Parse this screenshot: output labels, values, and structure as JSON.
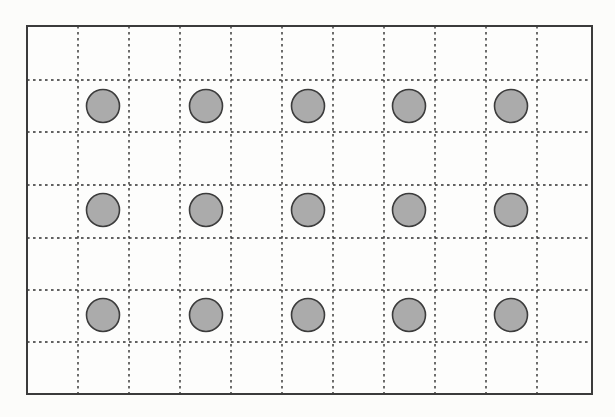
{
  "figure": {
    "canvas": {
      "width": 615,
      "height": 417,
      "background": "#fcfcfa"
    },
    "frame": {
      "x": 27,
      "y": 26,
      "width": 565,
      "height": 368,
      "stroke": "#3b3b3b",
      "stroke_width": 2,
      "fill": "#fdfdfc"
    },
    "grid": {
      "vertical_xs": [
        78,
        129,
        180,
        231,
        282,
        333,
        384,
        435,
        486,
        537
      ],
      "horizontal_ys": [
        80,
        132,
        185,
        238,
        290,
        342
      ],
      "stroke": "#2f2f2f",
      "stroke_width": 1.4,
      "dash": "2.6 3.4"
    },
    "dots": {
      "column_xs": [
        103,
        206,
        308,
        409,
        511
      ],
      "row_ys": [
        106,
        210,
        315
      ],
      "count": 15,
      "radius": 16.5,
      "fill": "#ababab",
      "stroke": "#3c3c3c",
      "stroke_width": 1.6
    }
  }
}
